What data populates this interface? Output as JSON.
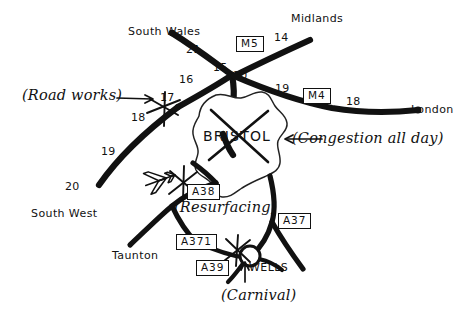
{
  "map": {
    "title": "Hand-drawn road map around Bristol",
    "ink_color": "#111111",
    "paper_color": "#ffffff",
    "city": {
      "name": "BRISTOL",
      "marker": "cross-out-x"
    },
    "destinations": [
      {
        "id": "south-wales",
        "label": "South Wales"
      },
      {
        "id": "midlands",
        "label": "Midlands"
      },
      {
        "id": "london",
        "label": "London"
      },
      {
        "id": "south-west",
        "label": "South West"
      },
      {
        "id": "taunton",
        "label": "Taunton"
      },
      {
        "id": "wells",
        "label": "WELLS"
      }
    ],
    "junction_numbers": [
      {
        "id": "j21",
        "label": "21"
      },
      {
        "id": "j16",
        "label": "16"
      },
      {
        "id": "j15",
        "label": "15"
      },
      {
        "id": "j14",
        "label": "14"
      },
      {
        "id": "j20",
        "label": "20"
      },
      {
        "id": "j19-m4",
        "label": "19"
      },
      {
        "id": "j18-m4",
        "label": "18"
      },
      {
        "id": "j17",
        "label": "17"
      },
      {
        "id": "j18",
        "label": "18"
      },
      {
        "id": "j19",
        "label": "19"
      },
      {
        "id": "j20-sw",
        "label": "20"
      }
    ],
    "road_shields": [
      {
        "id": "m5",
        "label": "M5"
      },
      {
        "id": "m4",
        "label": "M4"
      },
      {
        "id": "a38",
        "label": "A38"
      },
      {
        "id": "a37",
        "label": "A37"
      },
      {
        "id": "a371",
        "label": "A371"
      },
      {
        "id": "a39",
        "label": "A39"
      }
    ],
    "annotations": [
      {
        "id": "road-works",
        "label": "(Road works)"
      },
      {
        "id": "congestion",
        "label": "(Congestion all day)"
      },
      {
        "id": "resurfacing",
        "label": "(Resurfacing)"
      },
      {
        "id": "carnival",
        "label": "(Carnival)"
      }
    ],
    "symbols": [
      {
        "id": "airport",
        "name": "airplane-icon"
      },
      {
        "id": "wells-roundabout",
        "name": "roundabout-icon"
      },
      {
        "id": "blockage-j17",
        "name": "blockage-star-icon"
      },
      {
        "id": "blockage-a38",
        "name": "blockage-star-icon"
      },
      {
        "id": "blockage-a371",
        "name": "blockage-star-icon"
      },
      {
        "id": "bristol-crossout",
        "name": "cross-out-icon"
      }
    ]
  }
}
